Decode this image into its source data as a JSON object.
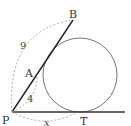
{
  "diagram": {
    "points": {
      "P": {
        "label": "P"
      },
      "A": {
        "label": "A"
      },
      "B": {
        "label": "B"
      },
      "T": {
        "label": "T"
      }
    },
    "measurements": {
      "PB": "9",
      "PA": "4",
      "PT": "x"
    },
    "colors": {
      "line": "#222222",
      "circle": "#777777",
      "dashed": "#999999"
    }
  }
}
